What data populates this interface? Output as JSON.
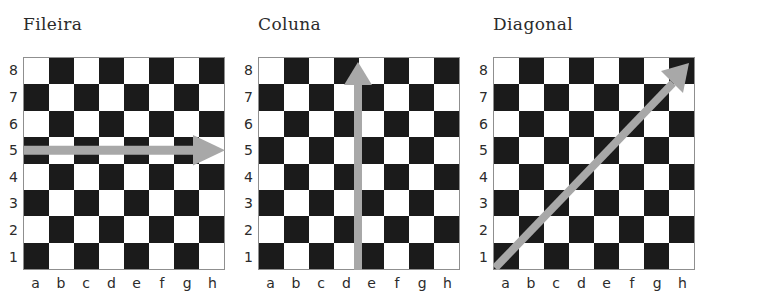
{
  "figure": {
    "caption_language": "pt",
    "board_size": 8,
    "files": [
      "a",
      "b",
      "c",
      "d",
      "e",
      "f",
      "g",
      "h"
    ],
    "ranks": [
      "8",
      "7",
      "6",
      "5",
      "4",
      "3",
      "2",
      "1"
    ],
    "colors": {
      "light_square": "#ffffff",
      "dark_square": "#1b1b1b",
      "board_border": "#8f8f8f",
      "arrow": "#a8a8a8",
      "label_text": "#2b2b2b",
      "background": "#ffffff"
    },
    "panels": [
      {
        "title": "Fileira",
        "arrow": {
          "name": "row-arrow",
          "direction": "right",
          "from": "a4",
          "to": "h4",
          "description": "horizontal arrow along rank 4 pointing right"
        }
      },
      {
        "title": "Coluna",
        "arrow": {
          "name": "column-arrow",
          "direction": "up",
          "from": "e1",
          "to": "e8",
          "description": "vertical arrow along file e pointing up"
        }
      },
      {
        "title": "Diagonal",
        "arrow": {
          "name": "diagonal-arrow",
          "direction": "up-right",
          "from": "a1",
          "to": "h8",
          "description": "diagonal arrow from a1 to h8 pointing up-right"
        }
      }
    ]
  }
}
